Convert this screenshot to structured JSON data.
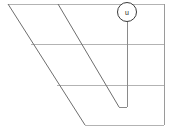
{
  "figure": {
    "name": "geometric-line-drawing",
    "width": 173,
    "height": 135,
    "background_color": "#ffffff",
    "colors": {
      "horizontal_line": "#b3b3b3",
      "slanted_line": "#6e6e6e",
      "vertical_line": "#8a8a8a",
      "right_edge": "#9a9a9a",
      "callout_stroke": "#3a3a3a",
      "callout_text": "#222222"
    },
    "stroke_widths": {
      "horizontal_line": 1,
      "slanted_line": 1,
      "vertical_line": 1,
      "callout_circle": 1
    }
  },
  "callout": {
    "label": "u",
    "center_x": 127,
    "center_y": 12,
    "radius": 9.5,
    "font_size": 7
  },
  "geometry": {
    "horizontal_lines": [
      {
        "name": "top-horizontal-line",
        "x1": 8,
        "y1": 4,
        "x2": 164,
        "y2": 4
      },
      {
        "name": "middle-horizontal-line",
        "x1": 31,
        "y1": 44,
        "x2": 164,
        "y2": 44
      },
      {
        "name": "lower-horizontal-line",
        "x1": 57,
        "y1": 85,
        "x2": 164,
        "y2": 85
      },
      {
        "name": "bottom-horizontal-line",
        "x1": 85,
        "y1": 125,
        "x2": 164,
        "y2": 125
      }
    ],
    "slanted_lines": [
      {
        "name": "left-slanted-line",
        "x1": 8,
        "y1": 4,
        "x2": 85,
        "y2": 125
      },
      {
        "name": "inner-slanted-line",
        "x1": 58,
        "y1": 4,
        "x2": 119,
        "y2": 107
      }
    ],
    "vertical_lines": [
      {
        "name": "callout-vertical-line",
        "x1": 127,
        "y1": 12,
        "x2": 127,
        "y2": 107
      },
      {
        "name": "right-edge-vertical-line",
        "x1": 164,
        "y1": 4,
        "x2": 164,
        "y2": 125
      }
    ],
    "connector_lines": [
      {
        "name": "callout-base-connector",
        "x1": 119,
        "y1": 107,
        "x2": 127,
        "y2": 107
      }
    ]
  }
}
